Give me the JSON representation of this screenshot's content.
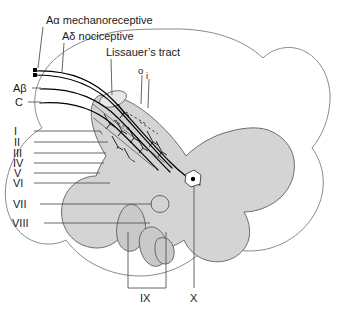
{
  "figure": {
    "colors": {
      "gray_matter": "#d4d4d4",
      "gray_matter_stroke": "#6e6e6e",
      "white_matter_fill": "#ffffff",
      "white_matter_stroke": "#8a8a8a",
      "fiber": "#000000",
      "leader_line": "#555555",
      "text": "#1a1a1a"
    }
  },
  "labels": {
    "fiber_types": [
      {
        "id": "a-alpha",
        "text": "Aα mechanoreceptive"
      },
      {
        "id": "a-delta",
        "text": "Aδ nociceptive"
      },
      {
        "id": "lissauer",
        "text": "Lissauer’s tract"
      }
    ],
    "tract_divisions": [
      {
        "id": "outer",
        "text": "o"
      },
      {
        "id": "inner",
        "text": "i"
      }
    ],
    "axon_labels": [
      {
        "id": "a-beta",
        "text": "Aβ"
      },
      {
        "id": "c-fiber",
        "text": "C"
      }
    ],
    "laminae": [
      {
        "id": "lamina-1",
        "text": "I"
      },
      {
        "id": "lamina-2",
        "text": "II"
      },
      {
        "id": "lamina-3",
        "text": "III"
      },
      {
        "id": "lamina-4",
        "text": "IV"
      },
      {
        "id": "lamina-5",
        "text": "V"
      },
      {
        "id": "lamina-6",
        "text": "VI"
      },
      {
        "id": "lamina-7",
        "text": "VII"
      },
      {
        "id": "lamina-8",
        "text": "VIII"
      }
    ],
    "bottom_laminae": [
      {
        "id": "lamina-9",
        "text": "IX"
      },
      {
        "id": "lamina-10",
        "text": "X"
      }
    ]
  }
}
